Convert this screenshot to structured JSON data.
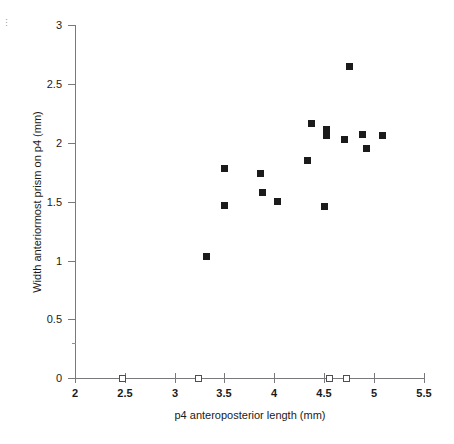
{
  "figure": {
    "corner_mark": "⋮"
  },
  "chart_data": {
    "type": "scatter",
    "title": "",
    "xlabel": "p4 anteroposterior length (mm)",
    "ylabel": "Width anteriormost prism on p4 (mm)",
    "xlim": [
      2,
      5.5
    ],
    "ylim": [
      0,
      3
    ],
    "xticks": [
      2,
      2.5,
      3,
      3.5,
      4,
      4.5,
      5,
      5.5
    ],
    "xtick_labels": [
      "2",
      "2.5",
      "3",
      "3.5",
      "4",
      "4.5",
      "5",
      "5.5"
    ],
    "yticks": [
      0,
      0.5,
      1,
      1.5,
      2,
      2.5,
      3
    ],
    "ytick_labels": [
      "0",
      "0.5",
      "1",
      "1.5",
      "2",
      "2.5",
      "3"
    ],
    "grid": false,
    "legend": null,
    "series": [
      {
        "name": "measured specimens",
        "marker": "filled-square",
        "color": "#1b1b1b",
        "points": [
          {
            "x": 3.32,
            "y": 1.03
          },
          {
            "x": 3.5,
            "y": 1.78
          },
          {
            "x": 3.5,
            "y": 1.47
          },
          {
            "x": 3.86,
            "y": 1.74
          },
          {
            "x": 3.88,
            "y": 1.58
          },
          {
            "x": 4.03,
            "y": 1.5
          },
          {
            "x": 4.33,
            "y": 1.85
          },
          {
            "x": 4.37,
            "y": 2.16
          },
          {
            "x": 4.5,
            "y": 1.46
          },
          {
            "x": 4.52,
            "y": 2.11
          },
          {
            "x": 4.52,
            "y": 2.06
          },
          {
            "x": 4.7,
            "y": 2.03
          },
          {
            "x": 4.75,
            "y": 2.65
          },
          {
            "x": 4.88,
            "y": 2.07
          },
          {
            "x": 4.92,
            "y": 1.95
          },
          {
            "x": 5.08,
            "y": 2.06
          }
        ]
      },
      {
        "name": "length-only specimens",
        "marker": "open-square",
        "color": "#4d4f52",
        "points": [
          {
            "x": 2.48,
            "y": 0
          },
          {
            "x": 3.24,
            "y": 0
          },
          {
            "x": 4.55,
            "y": 0
          },
          {
            "x": 4.72,
            "y": 0
          }
        ]
      }
    ]
  }
}
